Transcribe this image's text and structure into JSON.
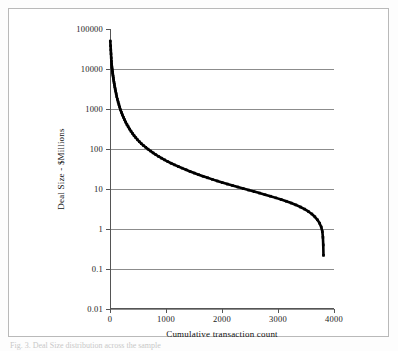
{
  "figure": {
    "caption": "Fig. 3. Deal Size distribution across the sample",
    "border_color": "#b9b9b9"
  },
  "chart_data": {
    "type": "scatter",
    "title": "",
    "xlabel": "Cumulative transaction count",
    "ylabel": "Deal Size - $Millions",
    "xlim": [
      0,
      4000
    ],
    "ylim": [
      0.01,
      100000
    ],
    "yscale": "log",
    "xscale": "linear",
    "grid": "horizontal",
    "legend": "none",
    "series_color": "#000000",
    "gridline_color": "#8c8c8c",
    "axis_color": "#555555",
    "xticks": [
      "0",
      "1000",
      "2000",
      "3000",
      "4000"
    ],
    "xtick_values": [
      0,
      1000,
      2000,
      3000,
      4000
    ],
    "yticks": [
      "0.01",
      "0.1",
      "1",
      "10",
      "100",
      "1000",
      "10000",
      "100000"
    ],
    "ytick_values": [
      0.01,
      0.1,
      1,
      10,
      100,
      1000,
      10000,
      100000
    ],
    "x": [
      5,
      10,
      14,
      18,
      22,
      26,
      30,
      34,
      38,
      42,
      46,
      50,
      55,
      60,
      66,
      72,
      78,
      85,
      92,
      100,
      110,
      120,
      132,
      145,
      158,
      172,
      188,
      205,
      222,
      240,
      260,
      280,
      302,
      325,
      350,
      375,
      402,
      430,
      460,
      492,
      525,
      560,
      598,
      638,
      680,
      724,
      770,
      818,
      868,
      920,
      975,
      1032,
      1092,
      1155,
      1220,
      1288,
      1358,
      1430,
      1505,
      1582,
      1662,
      1744,
      1828,
      1915,
      2004,
      2095,
      2188,
      2282,
      2378,
      2475,
      2572,
      2670,
      2768,
      2866,
      2962,
      3056,
      3148,
      3236,
      3320,
      3400,
      3474,
      3542,
      3604,
      3658,
      3704,
      3742,
      3772,
      3792,
      3802,
      3808,
      3812
    ],
    "y": [
      50000,
      38000,
      30000,
      24000,
      19000,
      15500,
      13000,
      11200,
      10000,
      9000,
      8200,
      7400,
      6600,
      5900,
      5200,
      4600,
      4100,
      3600,
      3200,
      2800,
      2400,
      2050,
      1750,
      1500,
      1300,
      1120,
      950,
      820,
      710,
      620,
      540,
      470,
      410,
      360,
      315,
      278,
      245,
      216,
      192,
      170,
      152,
      136,
      122,
      110,
      99,
      89,
      80,
      72,
      65,
      59,
      53.5,
      48.5,
      44,
      40,
      36.5,
      33.2,
      30.2,
      27.5,
      25,
      22.8,
      20.8,
      19,
      17.4,
      15.9,
      14.5,
      13.3,
      12.2,
      11.2,
      10.3,
      9.4,
      8.6,
      7.9,
      7.2,
      6.6,
      6.0,
      5.45,
      4.95,
      4.45,
      4.0,
      3.55,
      3.15,
      2.75,
      2.38,
      2.02,
      1.7,
      1.4,
      1.12,
      0.86,
      0.62,
      0.4,
      0.22,
      0.11,
      0.055,
      0.028
    ]
  }
}
